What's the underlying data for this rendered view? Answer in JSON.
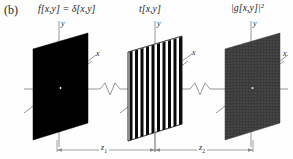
{
  "figure": {
    "part_label": "(b)",
    "background_color": "#fefefe",
    "ink_color": "#1a1a1a",
    "axis_color": "#8a8a8a"
  },
  "panels": [
    {
      "id": "input-plane",
      "title_lhs": "f",
      "title": "f[x,y] = δ[x,y]",
      "fill_color": "#000000",
      "kind": "solid-black-plane",
      "axis_y_label": "y",
      "axis_x_label": "x",
      "center_spot": "white-point"
    },
    {
      "id": "grating-plane",
      "title": "t[x,y]",
      "fill_color": "#ffffff",
      "stripe_color": "#0a0a0a",
      "kind": "vertical-grating-plane",
      "stripe_count": 10,
      "axis_y_label": "y",
      "axis_x_label": "x"
    },
    {
      "id": "output-plane",
      "title": "|g[x,y]|²",
      "fill_color": "#3d3d3d",
      "kind": "gray-noise-plane",
      "axis_y_label": "y",
      "axis_x_label": "x",
      "center_spot": "bright-point"
    }
  ],
  "dimensions": [
    {
      "id": "z1",
      "label": "z",
      "subscript": "1"
    },
    {
      "id": "z2",
      "label": "z",
      "subscript": "2"
    }
  ],
  "axis": {
    "break_symbol": "zigzag",
    "break_count": 2
  }
}
